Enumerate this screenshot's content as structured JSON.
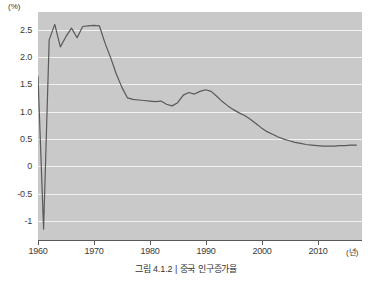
{
  "caption": "그림 4.1.2 | 중국 인구증가율",
  "axes": {
    "y_unit": "(%)",
    "x_unit": "(년)",
    "y_ticks": [
      "2.5",
      "2.0",
      "1.5",
      "1.0",
      "0.5",
      "0",
      "-0.5",
      "-1"
    ],
    "x_ticks": [
      "1960",
      "1970",
      "1980",
      "1990",
      "2000",
      "2010"
    ]
  },
  "colors": {
    "plot_background": "#c9c9c9",
    "gridline": "#f2f2f2",
    "line": "#595959",
    "axis": "#5a5a5a",
    "text": "#3a3a3a",
    "page_background": "#ffffff"
  },
  "chart_data": {
    "type": "line",
    "title": "그림 4.1.2 | 중국 인구증가율",
    "xlabel": "(년)",
    "ylabel": "(%)",
    "xlim": [
      1960,
      2018
    ],
    "ylim": [
      -1.25,
      3.0
    ],
    "ytick_values": [
      2.5,
      2.0,
      1.5,
      1.0,
      0.5,
      0,
      -0.5,
      -1
    ],
    "xtick_values": [
      1960,
      1970,
      1980,
      1990,
      2000,
      2010
    ],
    "grid": true,
    "legend": false,
    "series": [
      {
        "name": "중국 인구증가율",
        "x": [
          1960,
          1961,
          1962,
          1963,
          1964,
          1965,
          1966,
          1967,
          1968,
          1969,
          1970,
          1971,
          1972,
          1973,
          1974,
          1975,
          1976,
          1977,
          1978,
          1979,
          1980,
          1981,
          1982,
          1983,
          1984,
          1985,
          1986,
          1987,
          1988,
          1989,
          1990,
          1991,
          1992,
          1993,
          1994,
          1995,
          1996,
          1997,
          1998,
          1999,
          2000,
          2001,
          2002,
          2003,
          2004,
          2005,
          2006,
          2007,
          2008,
          2009,
          2010,
          2011,
          2012,
          2013,
          2014,
          2015,
          2016,
          2017
        ],
        "values": [
          1.8,
          -1.05,
          2.48,
          2.77,
          2.35,
          2.54,
          2.7,
          2.52,
          2.73,
          2.74,
          2.75,
          2.74,
          2.42,
          2.15,
          1.85,
          1.6,
          1.4,
          1.37,
          1.36,
          1.35,
          1.34,
          1.33,
          1.34,
          1.28,
          1.25,
          1.31,
          1.45,
          1.5,
          1.47,
          1.52,
          1.55,
          1.52,
          1.43,
          1.33,
          1.25,
          1.18,
          1.12,
          1.07,
          1.0,
          0.92,
          0.84,
          0.77,
          0.72,
          0.67,
          0.63,
          0.6,
          0.57,
          0.55,
          0.53,
          0.52,
          0.51,
          0.5,
          0.5,
          0.5,
          0.51,
          0.51,
          0.52,
          0.52
        ]
      }
    ]
  }
}
